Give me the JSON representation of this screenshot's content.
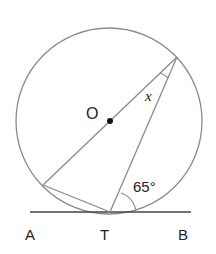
{
  "diagram": {
    "type": "circle-tangent-geometry",
    "center_label": "O",
    "angle_label": "x",
    "given_angle": "65°",
    "points": {
      "A": "A",
      "T": "T",
      "B": "B"
    },
    "colors": {
      "stroke": "#8a8a8a",
      "tangent": "#444444",
      "text": "#222222"
    }
  }
}
